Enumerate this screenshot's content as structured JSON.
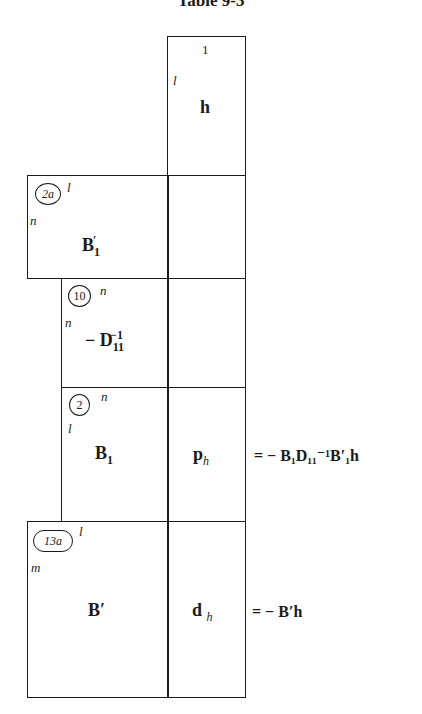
{
  "title": "Table 9-3",
  "top_block": {
    "col_dim": "1",
    "row_dim": "l",
    "matrix": "h"
  },
  "rows": [
    {
      "step": "2a",
      "col_dim": "l",
      "row_dim": "n",
      "matrix": "B",
      "matrix_sub": "1",
      "matrix_sup": "′",
      "right": ""
    },
    {
      "step": "10",
      "col_dim": "n",
      "row_dim": "n",
      "matrix": "− D",
      "matrix_sub": "11",
      "matrix_sup": "−1",
      "right": ""
    },
    {
      "step": "2",
      "col_dim": "n",
      "row_dim": "l",
      "matrix": "B",
      "matrix_sub": "1",
      "matrix_sup": "",
      "right": "p",
      "right_sub": "h",
      "result": "= − B₁D₁₁⁻¹B′₁h"
    },
    {
      "step": "13a",
      "col_dim": "l",
      "row_dim": "m",
      "matrix": "B′",
      "right": "d",
      "right_sub": "h",
      "result": "= − B′h"
    }
  ]
}
